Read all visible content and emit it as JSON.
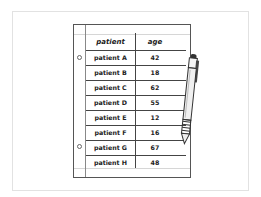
{
  "table": {
    "headers": [
      "patient",
      "age"
    ],
    "rows": [
      {
        "patient": "patient A",
        "age": "42"
      },
      {
        "patient": "patient B",
        "age": "18"
      },
      {
        "patient": "patient C",
        "age": "62"
      },
      {
        "patient": "patient D",
        "age": "55"
      },
      {
        "patient": "patient E",
        "age": "12"
      },
      {
        "patient": "patient F",
        "age": "16"
      },
      {
        "patient": "patient G",
        "age": "67"
      },
      {
        "patient": "patient H",
        "age": "48"
      }
    ]
  },
  "icons": {
    "pen": "pen-icon"
  }
}
